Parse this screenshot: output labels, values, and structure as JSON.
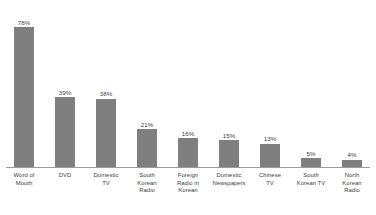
{
  "chart_data": {
    "type": "bar",
    "title": "",
    "subtitle": "",
    "xlabel": "",
    "ylabel": "",
    "ylim": [
      0,
      80
    ],
    "grid": false,
    "legend": false,
    "value_suffix": "%",
    "categories": [
      "Word of Mouth",
      "DVD",
      "Domestic TV",
      "South Korean Radio",
      "Foreign Radio in Korean",
      "Domestic Newspapers",
      "Chinese TV",
      "South Korean TV",
      "North Korean Radio"
    ],
    "category_lines": [
      [
        "Word of",
        "Mouth"
      ],
      [
        "DVD"
      ],
      [
        "Domestic",
        "TV"
      ],
      [
        "South",
        "Korean",
        "Radio"
      ],
      [
        "Foreign",
        "Radio in",
        "Korean"
      ],
      [
        "Domestic",
        "Newspapers"
      ],
      [
        "Chinese",
        "TV"
      ],
      [
        "South",
        "Korean TV"
      ],
      [
        "North",
        "Korean",
        "Radio"
      ]
    ],
    "values": [
      78,
      39,
      38,
      21,
      16,
      15,
      13,
      5,
      4
    ],
    "value_labels": [
      "78%",
      "39%",
      "38%",
      "21%",
      "16%",
      "15%",
      "13%",
      "5%",
      "4%"
    ],
    "colors": {
      "bar": "#7f7f7f",
      "axis": "#9a9a9a",
      "text": "#3d3d3d",
      "background": "#ffffff"
    }
  }
}
